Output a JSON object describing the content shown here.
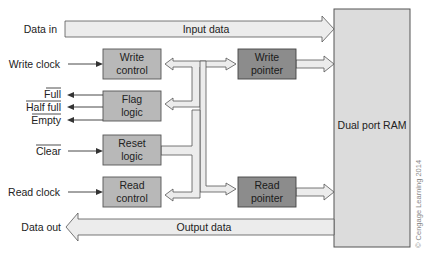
{
  "diagram": {
    "colors": {
      "control_block": "#b8b8b8",
      "pointer_block": "#8c8c8c",
      "ram_block": "#dcdcdc",
      "bus": "#ececec",
      "line": "#333333"
    },
    "ram": {
      "label": "Dual port RAM"
    },
    "buses": {
      "input": {
        "label": "Input data"
      },
      "output": {
        "label": "Output data"
      }
    },
    "blocks": {
      "write_control": {
        "line1": "Write",
        "line2": "control"
      },
      "flag_logic": {
        "line1": "Flag",
        "line2": "logic"
      },
      "reset_logic": {
        "line1": "Reset",
        "line2": "logic"
      },
      "read_control": {
        "line1": "Read",
        "line2": "control"
      },
      "write_pointer": {
        "line1": "Write",
        "line2": "pointer"
      },
      "read_pointer": {
        "line1": "Read",
        "line2": "pointer"
      }
    },
    "signals": {
      "data_in": "Data in",
      "write_clock": "Write clock",
      "full": "Full",
      "half_full": "Half full",
      "empty": "Empty",
      "clear": "Clear",
      "read_clock": "Read clock",
      "data_out": "Data out"
    },
    "copyright": "© Cengage Learning 2014"
  }
}
